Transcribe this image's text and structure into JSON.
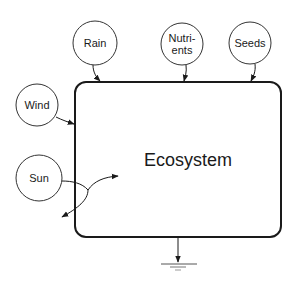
{
  "diagram": {
    "title": "Ecosystem",
    "main_box": {
      "label": "Ecosystem",
      "x": 75,
      "y": 82,
      "width": 206,
      "height": 155,
      "corner_radius": 11
    },
    "inputs": [
      {
        "id": "rain",
        "label": "Rain",
        "lines": [
          "Rain"
        ],
        "cx": 95,
        "cy": 43,
        "r": 22
      },
      {
        "id": "nutrients",
        "label": "Nutrients",
        "lines": [
          "Nutri-",
          "ents"
        ],
        "cx": 182,
        "cy": 44,
        "r": 21
      },
      {
        "id": "seeds",
        "label": "Seeds",
        "lines": [
          "Seeds"
        ],
        "cx": 250,
        "cy": 43,
        "r": 21
      },
      {
        "id": "wind",
        "label": "Wind",
        "lines": [
          "Wind"
        ],
        "cx": 37,
        "cy": 105,
        "r": 21
      },
      {
        "id": "sun",
        "label": "Sun",
        "lines": [
          "Sun"
        ],
        "cx": 39,
        "cy": 178,
        "r": 23
      }
    ],
    "ground": {
      "label": "",
      "x": 178,
      "y_top": 237,
      "y_bottom": 262
    },
    "colors": {
      "stroke": "#1a1a1a",
      "background": "#ffffff"
    }
  }
}
